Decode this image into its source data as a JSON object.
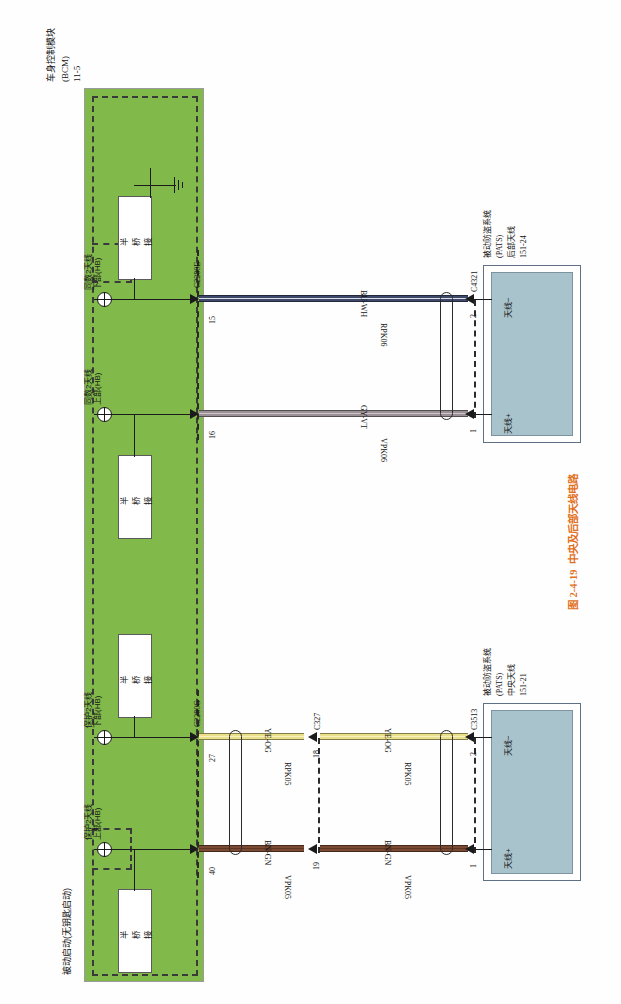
{
  "figure": {
    "caption_number": "图 2-4-19",
    "caption_text": "中央及后部天线电路",
    "caption_color": "#e2711d"
  },
  "module": {
    "name_line1": "车身控制模块",
    "name_line2": "(BCM)",
    "name_line3": "11-5",
    "system_label": "被动启动(无钥匙启动)",
    "panel_color": "#82b94b",
    "internal_blocks": [
      {
        "label": "半桥接"
      },
      {
        "label": "半桥接"
      },
      {
        "label": "半桥接"
      },
      {
        "label": "半桥接"
      }
    ],
    "pin_functions": [
      {
        "line1": "同数2天线",
        "line2": "下部(HB)"
      },
      {
        "line1": "同数2天线",
        "line2": "上部(HB)"
      },
      {
        "line1": "保护2天线",
        "line2": "下部(HB)"
      },
      {
        "line1": "保护2天线",
        "line2": "上部(HB)"
      }
    ],
    "ground_symbol": "chassis-ground"
  },
  "connectors": {
    "c2280e": {
      "name": "C2280E",
      "pins": [
        "15",
        "16"
      ]
    },
    "c2280g": {
      "name": "C2280G",
      "pins": [
        "27",
        "40"
      ]
    },
    "c327": {
      "name": "C327",
      "pins": [
        "18",
        "19"
      ]
    },
    "c4321": {
      "name": "C4321",
      "pins": [
        "2",
        "1"
      ]
    },
    "c3513": {
      "name": "C3513",
      "pins": [
        "2",
        "1"
      ]
    }
  },
  "wires": [
    {
      "id": "bu-wh",
      "color_code": "BU-WH",
      "circuit": "RPK06",
      "core": "#3f4a6b",
      "stripe": "#d8dde8"
    },
    {
      "id": "gy-vt",
      "color_code": "GY-VT",
      "circuit": "VPK06",
      "core": "#9a8f94",
      "stripe": "#cfc6cb"
    },
    {
      "id": "ye-og-right",
      "color_code": "YE-OG",
      "circuit": "RPK05",
      "core": "#ebe08a",
      "stripe": "#f6f0c0"
    },
    {
      "id": "ye-og-left",
      "color_code": "YE-OG",
      "circuit": "RPK05",
      "core": "#ebe08a",
      "stripe": "#f6f0c0"
    },
    {
      "id": "bn-gn-right",
      "color_code": "BN-GN",
      "circuit": "VPK05",
      "core": "#7a4a32",
      "stripe": "#5d3624"
    },
    {
      "id": "bn-gn-left",
      "color_code": "BN-GN",
      "circuit": "VPK05",
      "core": "#7a4a32",
      "stripe": "#5d3624"
    }
  ],
  "devices": [
    {
      "id": "rear-antenna",
      "name_line1": "被动防盗系统",
      "name_line2": "(PATS)",
      "name_line3": "后部天线",
      "name_line4": "151-24",
      "terminals": [
        "天线−",
        "天线+"
      ],
      "body_color": "#a9c3cd"
    },
    {
      "id": "center-antenna",
      "name_line1": "被动防盗系统",
      "name_line2": "(PATS)",
      "name_line3": "中央天线",
      "name_line4": "151-21",
      "terminals": [
        "天线−",
        "天线+"
      ],
      "body_color": "#a9c3cd"
    }
  ]
}
